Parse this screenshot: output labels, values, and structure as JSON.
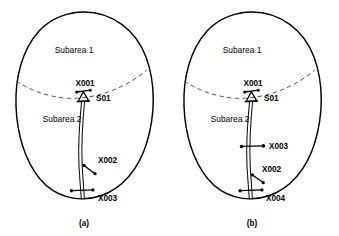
{
  "figure": {
    "panels": [
      {
        "caption": "(a)",
        "caption_x": 84,
        "caption_y": 226,
        "origin_x": 0,
        "areas": [
          {
            "label": "Subarea 1",
            "x": 74,
            "y": 53
          },
          {
            "label": "Subarea 2",
            "x": 62,
            "y": 122
          }
        ],
        "devices": [
          {
            "id": "X001",
            "label": "X001",
            "type": "substation-bus",
            "label_x": 85,
            "label_y": 86,
            "anchor": "middle",
            "node_x": 84,
            "node_y": 96
          },
          {
            "id": "S01",
            "label": "S01",
            "type": "substation-marker",
            "label_x": 96,
            "label_y": 101,
            "anchor": "start",
            "node_x": 84,
            "node_y": 98
          },
          {
            "id": "X002",
            "label": "X002",
            "type": "open-switch",
            "label_x": 98,
            "label_y": 163,
            "anchor": "start",
            "node_x": 86,
            "node_y": 168
          },
          {
            "id": "X003",
            "label": "X003",
            "type": "closed-breaker",
            "label_x": 98,
            "label_y": 201,
            "anchor": "start",
            "node_x": 71,
            "node_y": 191
          }
        ]
      },
      {
        "caption": "(b)",
        "caption_x": 252,
        "caption_y": 226,
        "origin_x": 168,
        "areas": [
          {
            "label": "Subarea 1",
            "x": 242,
            "y": 53
          },
          {
            "label": "Subarea 2",
            "x": 230,
            "y": 122
          }
        ],
        "devices": [
          {
            "id": "X001",
            "label": "X001",
            "type": "substation-bus",
            "label_x": 253,
            "label_y": 86,
            "anchor": "middle",
            "node_x": 252,
            "node_y": 96
          },
          {
            "id": "S01",
            "label": "S01",
            "type": "substation-marker",
            "label_x": 264,
            "label_y": 101,
            "anchor": "start",
            "node_x": 252,
            "node_y": 98
          },
          {
            "id": "X003",
            "label": "X003",
            "type": "closed-breaker",
            "label_x": 269,
            "label_y": 149,
            "anchor": "start",
            "node_x": 252,
            "node_y": 146
          },
          {
            "id": "X002",
            "label": "X002",
            "type": "open-switch",
            "label_x": 262,
            "label_y": 172,
            "anchor": "start",
            "node_x": 254,
            "node_y": 178
          },
          {
            "id": "X004",
            "label": "X004",
            "type": "closed-breaker",
            "label_x": 266,
            "label_y": 201,
            "anchor": "start",
            "node_x": 240,
            "node_y": 191
          }
        ]
      }
    ],
    "colors": {
      "ink": "#000000",
      "divider": "#5a5a5a",
      "background": "#ffffff"
    }
  }
}
